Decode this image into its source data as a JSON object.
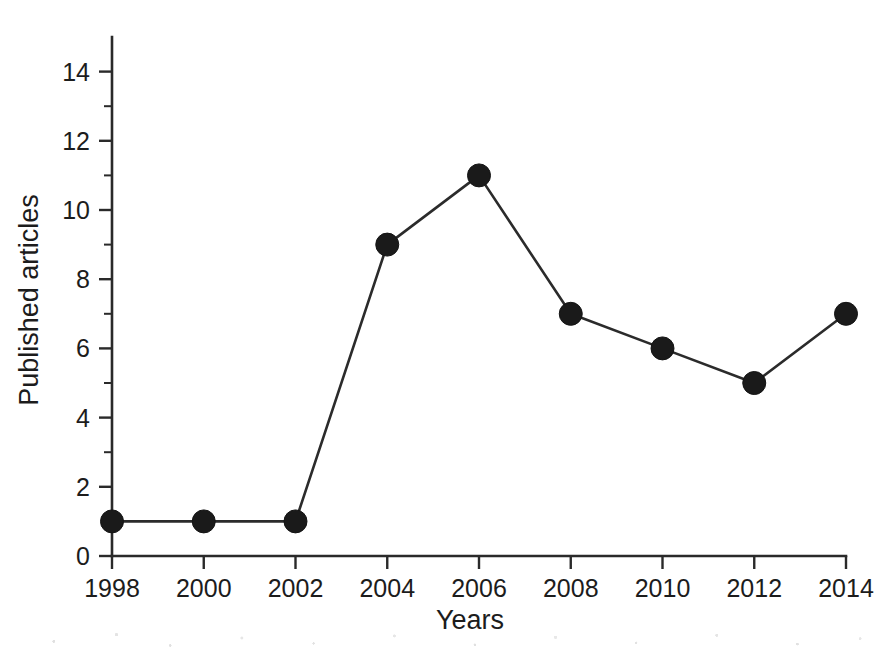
{
  "chart_data": {
    "type": "line",
    "title": "",
    "subtitle": "",
    "xlabel": "Years",
    "ylabel": "Published articles",
    "x": [
      1998,
      2000,
      2002,
      2004,
      2006,
      2008,
      2010,
      2012,
      2014
    ],
    "categories": [
      "1998",
      "2000",
      "2002",
      "2004",
      "2006",
      "2008",
      "2010",
      "2012",
      "2014"
    ],
    "values": [
      1,
      1,
      1,
      9,
      11,
      7,
      6,
      5,
      7
    ],
    "series": [
      {
        "name": "Published articles",
        "values": [
          1,
          1,
          1,
          9,
          11,
          7,
          6,
          5,
          7
        ]
      }
    ],
    "xlim": [
      1998,
      2014
    ],
    "ylim": [
      0,
      15
    ],
    "x_tick_labels": [
      "1998",
      "2000",
      "2002",
      "2004",
      "2006",
      "2008",
      "2010",
      "2012",
      "2014"
    ],
    "y_tick_labels": [
      "0",
      "2",
      "4",
      "6",
      "8",
      "10",
      "12",
      "14"
    ],
    "y_major_ticks": [
      0,
      2,
      4,
      6,
      8,
      10,
      12,
      14
    ],
    "y_minor_ticks": [
      1,
      3,
      5,
      7,
      9,
      11,
      13
    ],
    "grid": false,
    "legend": false,
    "legend_position": "none",
    "marker": "filled-circle",
    "marker_color": "#1a1a1a",
    "line_color": "#2b2b2b",
    "background_color": "#ffffff",
    "axis_color": "#2a2a2a"
  },
  "axes": {
    "x_title": "Years",
    "y_title": "Published articles"
  },
  "points": [
    {
      "year": "1998",
      "value": "1"
    },
    {
      "year": "2000",
      "value": "1"
    },
    {
      "year": "2002",
      "value": "1"
    },
    {
      "year": "2004",
      "value": "9"
    },
    {
      "year": "2006",
      "value": "11"
    },
    {
      "year": "2008",
      "value": "7"
    },
    {
      "year": "2010",
      "value": "6"
    },
    {
      "year": "2012",
      "value": "5"
    },
    {
      "year": "2014",
      "value": "7"
    }
  ]
}
